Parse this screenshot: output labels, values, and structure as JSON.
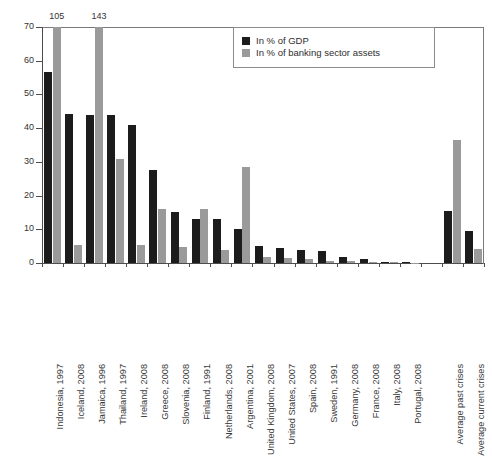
{
  "chart_data": {
    "type": "bar",
    "title": "",
    "subtitle": "",
    "xlabel": "",
    "ylabel": "",
    "ylim": [
      0,
      70
    ],
    "yticks": [
      0,
      10,
      20,
      30,
      40,
      50,
      60,
      70
    ],
    "grid": false,
    "legend_position": "top-right",
    "categories": [
      "Indonesia, 1997",
      "Iceland, 2008",
      "Jamaica, 1996",
      "Thailand, 1997",
      "Ireland, 2008",
      "Greece, 2008",
      "Slovenia, 2008",
      "Finland, 1991",
      "Netherlands, 2008",
      "Argentina, 2001",
      "United Kingdom, 2008",
      "United States, 2007",
      "Spain, 2008",
      "Sweden, 1991",
      "Germany, 2008",
      "France, 2008",
      "Italy, 2008",
      "Portugal, 2008",
      "",
      "Average past crises",
      "Average current crises"
    ],
    "series": [
      {
        "name": "In % of GDP",
        "color": "#1c1c1c",
        "values": [
          56.8,
          44.2,
          44.0,
          43.8,
          40.8,
          27.7,
          15.1,
          13.1,
          13.0,
          10.1,
          5.0,
          4.6,
          4.0,
          3.6,
          1.8,
          1.2,
          0.3,
          0.2,
          null,
          15.4,
          9.4
        ]
      },
      {
        "name": "In % of banking sector assets",
        "color": "#9a9a9a",
        "values": [
          105.0,
          5.4,
          143.0,
          31.0,
          5.3,
          16.1,
          4.8,
          15.9,
          3.8,
          28.5,
          1.9,
          1.4,
          1.2,
          0.6,
          0.5,
          0.4,
          0.2,
          0.1,
          null,
          36.6,
          4.3
        ]
      }
    ],
    "clipped_value_labels": [
      {
        "category": "Indonesia, 1997",
        "series": "In % of banking sector assets",
        "label": "105"
      },
      {
        "category": "Jamaica, 1996",
        "series": "In % of banking sector assets",
        "label": "143"
      }
    ]
  },
  "legend": {
    "items": [
      {
        "label": "In % of GDP",
        "color": "#1c1c1c",
        "swatch": "square-black-swatch"
      },
      {
        "label": "In % of banking sector assets",
        "color": "#9a9a9a",
        "swatch": "square-gray-swatch"
      }
    ]
  },
  "axis": {
    "y_tick_labels": [
      "0",
      "10",
      "20",
      "30",
      "40",
      "50",
      "60",
      "70"
    ]
  }
}
